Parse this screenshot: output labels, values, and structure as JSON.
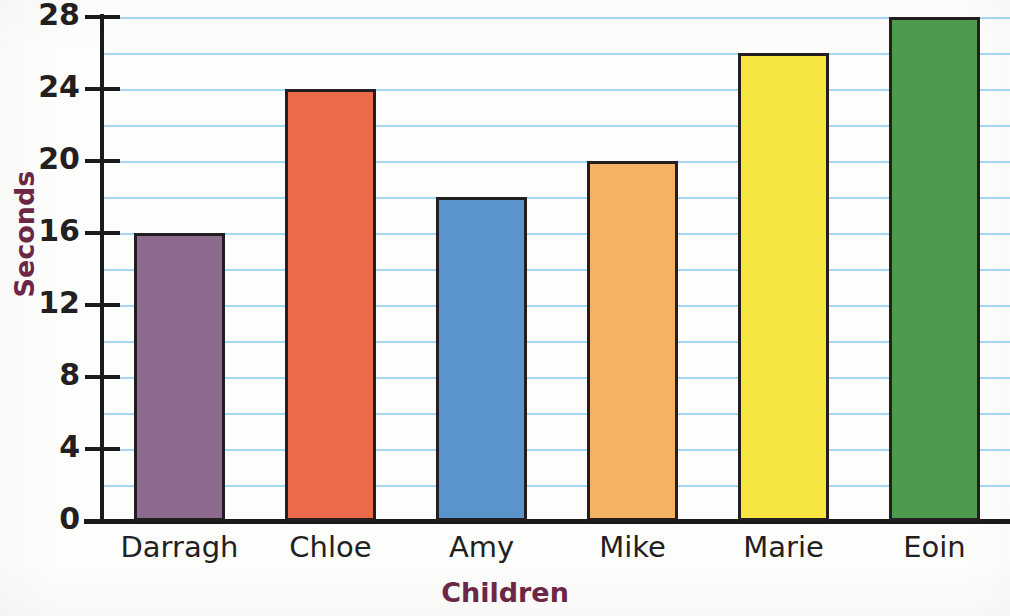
{
  "chart_data": {
    "type": "bar",
    "title": "",
    "xlabel": "Children",
    "ylabel": "Seconds",
    "categories": [
      "Darragh",
      "Chloe",
      "Amy",
      "Mike",
      "Marie",
      "Eoin"
    ],
    "values": [
      16,
      24,
      18,
      20,
      26,
      28
    ],
    "ylim": [
      0,
      28
    ],
    "y_major_ticks": [
      0,
      4,
      8,
      12,
      16,
      20,
      24,
      28
    ],
    "y_tick_labels": [
      "0",
      "4",
      "8",
      "12",
      "16",
      "20",
      "24",
      "28"
    ],
    "gridlines": [
      2,
      4,
      6,
      8,
      10,
      12,
      14,
      16,
      18,
      20,
      22,
      24,
      26,
      28
    ],
    "grid": true,
    "grid_interval": 2,
    "legend": "none",
    "bar_colors": [
      "#8d6b8e",
      "#ea6a4a",
      "#5b93cc",
      "#f6b264",
      "#f7e642",
      "#4f9b4e"
    ],
    "bar_border_color": "#231f20",
    "gridline_color": "#a5d8f3",
    "axis_color": "#1a1a1a",
    "axis_title_color": "#6e2747",
    "tick_label_color": "#231f20",
    "category_label_color": "#231f20",
    "background_color": "#ffffff"
  }
}
